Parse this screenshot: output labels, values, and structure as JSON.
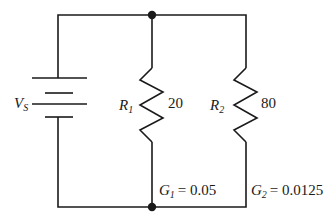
{
  "diagram": {
    "type": "parallel-circuit",
    "source": {
      "label_main": "V",
      "label_sub": "S"
    },
    "resistors": [
      {
        "label_main": "R",
        "label_sub": "1",
        "value": "20",
        "conductance_main": "G",
        "conductance_sub": "1",
        "conductance_value": "= 0.05"
      },
      {
        "label_main": "R",
        "label_sub": "2",
        "value": "80",
        "conductance_main": "G",
        "conductance_sub": "2",
        "conductance_value": "= 0.0125"
      }
    ],
    "colors": {
      "stroke": "#1a1a1a",
      "background": "#ffffff"
    }
  }
}
